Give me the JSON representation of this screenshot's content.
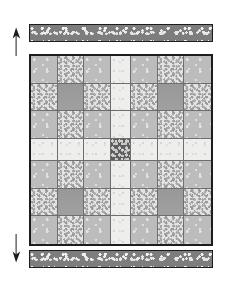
{
  "figure": {
    "colors": {
      "border": "#1d1d1d",
      "binding_fabric": "#7d7d7d",
      "gray_dot_fabric": "#bcbcbc",
      "light_speckle_fabric": "#e3e3e3",
      "solid_gray_fabric": "#9d9d9d",
      "sashing_fabric": "#eeeeec",
      "center_cornerstone": "#5e5e5e",
      "seam_line": "#6e6e6e",
      "page_background": "#ffffff"
    }
  },
  "bindings": {
    "top": {
      "label": "Top binding strip",
      "fabric": "dark-speckle"
    },
    "bottom": {
      "label": "Bottom binding strip",
      "fabric": "dark-speckle"
    }
  },
  "arrows": {
    "top": {
      "label": "Direction arrow up",
      "direction": "up"
    },
    "bottom": {
      "label": "Direction arrow down",
      "direction": "down"
    }
  },
  "quilt": {
    "label": "Quilt top",
    "columns": 7,
    "rows": 7,
    "sashing_column_index": 3,
    "sashing_row_index": 3,
    "grid": [
      [
        "gray-dot",
        "light-speckle",
        "gray-dot",
        "sashing",
        "gray-dot",
        "light-speckle",
        "gray-dot"
      ],
      [
        "light-speckle",
        "solid-gray",
        "light-speckle",
        "sashing",
        "light-speckle",
        "solid-gray",
        "light-speckle"
      ],
      [
        "gray-dot",
        "light-speckle",
        "gray-dot",
        "sashing",
        "gray-dot",
        "light-speckle",
        "gray-dot"
      ],
      [
        "sashing",
        "sashing",
        "sashing",
        "center-dark",
        "sashing",
        "sashing",
        "sashing"
      ],
      [
        "gray-dot",
        "light-speckle",
        "gray-dot",
        "sashing",
        "gray-dot",
        "light-speckle",
        "gray-dot"
      ],
      [
        "light-speckle",
        "solid-gray",
        "light-speckle",
        "sashing",
        "light-speckle",
        "solid-gray",
        "light-speckle"
      ],
      [
        "gray-dot",
        "light-speckle",
        "gray-dot",
        "sashing",
        "gray-dot",
        "light-speckle",
        "gray-dot"
      ]
    ],
    "fabric_names": {
      "gray-dot": "Gray dotted patch",
      "light-speckle": "Light speckled patch",
      "solid-gray": "Solid gray patch",
      "sashing": "Light sashing strip",
      "center-dark": "Dark speckled center cornerstone"
    }
  }
}
